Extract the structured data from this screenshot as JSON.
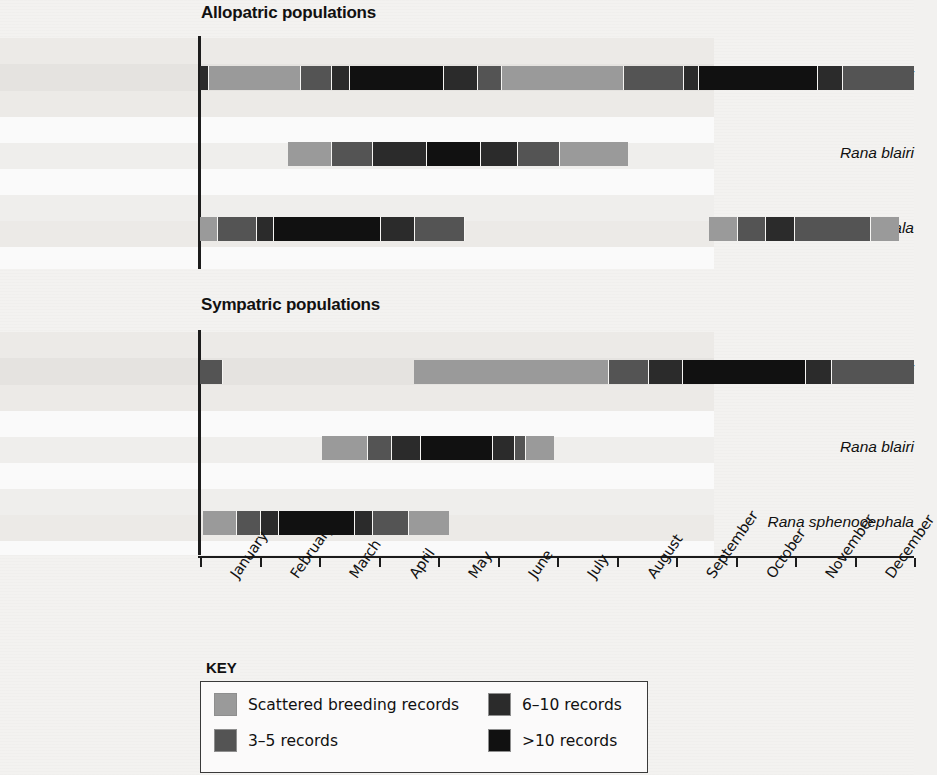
{
  "figure": {
    "panels": [
      {
        "title": "Allopatric populations"
      },
      {
        "title": "Sympatric populations"
      }
    ],
    "species": [
      "Rana berlandieri",
      "Rana blairi",
      "Rana sphenocephala"
    ],
    "months": [
      "January",
      "February",
      "March",
      "April",
      "May",
      "June",
      "July",
      "August",
      "September",
      "October",
      "November",
      "December"
    ]
  },
  "key": {
    "title": "KEY",
    "items": [
      {
        "label": "Scattered breeding records",
        "color": "#9a9a9a"
      },
      {
        "label": "3–5 records",
        "color": "#545454"
      },
      {
        "label": "6–10 records",
        "color": "#2b2b2b"
      },
      {
        "label": ">10 records",
        "color": "#111111"
      }
    ]
  },
  "chart_data": {
    "type": "bar",
    "subtype": "horizontal-gantt-timeline",
    "xlabel": "",
    "ylabel": "",
    "x_categories": [
      "January",
      "February",
      "March",
      "April",
      "May",
      "June",
      "July",
      "August",
      "September",
      "October",
      "November",
      "December"
    ],
    "x_axis_units": "month (continuous, January start = 0, December end = 12)",
    "xlim": [
      0,
      12
    ],
    "grid": false,
    "legend_position": "below-plot",
    "levels": [
      {
        "name": "Scattered breeding records",
        "color": "#9a9a9a",
        "code": "scattered"
      },
      {
        "name": "3–5 records",
        "color": "#545454",
        "code": "3-5"
      },
      {
        "name": "6–10 records",
        "color": "#2b2b2b",
        "code": "6-10"
      },
      {
        "name": ">10 records",
        "color": "#111111",
        "code": ">10"
      }
    ],
    "panels": [
      {
        "title": "Allopatric populations",
        "rows": [
          {
            "species": "Rana berlandieri",
            "segments": [
              {
                "start": 0.0,
                "end": 0.15,
                "level": "6-10"
              },
              {
                "start": 0.15,
                "end": 1.7,
                "level": "scattered"
              },
              {
                "start": 1.7,
                "end": 2.22,
                "level": "3-5"
              },
              {
                "start": 2.22,
                "end": 2.52,
                "level": "6-10"
              },
              {
                "start": 2.52,
                "end": 4.1,
                "level": ">10"
              },
              {
                "start": 4.1,
                "end": 4.68,
                "level": "6-10"
              },
              {
                "start": 4.68,
                "end": 5.08,
                "level": "3-5"
              },
              {
                "start": 5.08,
                "end": 7.13,
                "level": "scattered"
              },
              {
                "start": 7.13,
                "end": 8.13,
                "level": "3-5"
              },
              {
                "start": 8.13,
                "end": 8.38,
                "level": "6-10"
              },
              {
                "start": 8.38,
                "end": 10.38,
                "level": ">10"
              },
              {
                "start": 10.38,
                "end": 10.8,
                "level": "6-10"
              },
              {
                "start": 10.8,
                "end": 12.0,
                "level": "3-5"
              }
            ]
          },
          {
            "species": "Rana blairi",
            "segments": [
              {
                "start": 1.48,
                "end": 2.22,
                "level": "scattered"
              },
              {
                "start": 2.22,
                "end": 2.9,
                "level": "3-5"
              },
              {
                "start": 2.9,
                "end": 3.82,
                "level": "6-10"
              },
              {
                "start": 3.82,
                "end": 4.72,
                "level": ">10"
              },
              {
                "start": 4.72,
                "end": 5.35,
                "level": "6-10"
              },
              {
                "start": 5.35,
                "end": 6.05,
                "level": "3-5"
              },
              {
                "start": 6.05,
                "end": 7.2,
                "level": "scattered"
              }
            ]
          },
          {
            "species": "Rana sphenocephala",
            "segments": [
              {
                "start": 0.0,
                "end": 0.3,
                "level": "scattered"
              },
              {
                "start": 0.3,
                "end": 0.95,
                "level": "3-5"
              },
              {
                "start": 0.95,
                "end": 1.25,
                "level": "6-10"
              },
              {
                "start": 1.25,
                "end": 3.05,
                "level": ">10"
              },
              {
                "start": 3.05,
                "end": 3.62,
                "level": "6-10"
              },
              {
                "start": 3.62,
                "end": 4.45,
                "level": "3-5"
              },
              {
                "start": 8.55,
                "end": 9.05,
                "level": "scattered"
              },
              {
                "start": 9.05,
                "end": 9.52,
                "level": "3-5"
              },
              {
                "start": 9.52,
                "end": 10.0,
                "level": "6-10"
              },
              {
                "start": 10.0,
                "end": 11.28,
                "level": "3-5"
              },
              {
                "start": 11.28,
                "end": 11.75,
                "level": "scattered"
              }
            ]
          }
        ]
      },
      {
        "title": "Sympatric populations",
        "rows": [
          {
            "species": "Rana berlandieri",
            "segments": [
              {
                "start": 0.0,
                "end": 0.38,
                "level": "3-5"
              },
              {
                "start": 3.6,
                "end": 6.88,
                "level": "scattered"
              },
              {
                "start": 6.88,
                "end": 7.55,
                "level": "3-5"
              },
              {
                "start": 7.55,
                "end": 8.12,
                "level": "6-10"
              },
              {
                "start": 8.12,
                "end": 10.18,
                "level": ">10"
              },
              {
                "start": 10.18,
                "end": 10.62,
                "level": "6-10"
              },
              {
                "start": 10.62,
                "end": 12.0,
                "level": "3-5"
              }
            ]
          },
          {
            "species": "Rana blairi",
            "segments": [
              {
                "start": 2.05,
                "end": 2.82,
                "level": "scattered"
              },
              {
                "start": 2.82,
                "end": 3.22,
                "level": "3-5"
              },
              {
                "start": 3.22,
                "end": 3.72,
                "level": "6-10"
              },
              {
                "start": 3.72,
                "end": 4.92,
                "level": ">10"
              },
              {
                "start": 4.92,
                "end": 5.3,
                "level": "6-10"
              },
              {
                "start": 5.3,
                "end": 5.48,
                "level": "3-5"
              },
              {
                "start": 5.48,
                "end": 5.95,
                "level": "scattered"
              }
            ]
          },
          {
            "species": "Rana sphenocephala",
            "segments": [
              {
                "start": 0.05,
                "end": 0.62,
                "level": "scattered"
              },
              {
                "start": 0.62,
                "end": 1.02,
                "level": "3-5"
              },
              {
                "start": 1.02,
                "end": 1.32,
                "level": "6-10"
              },
              {
                "start": 1.32,
                "end": 2.6,
                "level": ">10"
              },
              {
                "start": 2.6,
                "end": 2.9,
                "level": "6-10"
              },
              {
                "start": 2.9,
                "end": 3.52,
                "level": "3-5"
              },
              {
                "start": 3.52,
                "end": 4.18,
                "level": "scattered"
              }
            ]
          }
        ]
      }
    ]
  }
}
